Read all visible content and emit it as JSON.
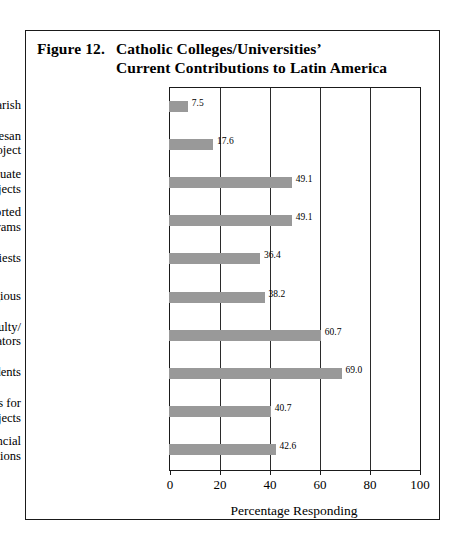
{
  "figure": {
    "number": "Figure 12.",
    "title_line1": "Catholic Colleges/Universities’",
    "title_line2": "Current Contributions to Latin America"
  },
  "chart_data": {
    "type": "bar",
    "orientation": "horizontal",
    "title": "Figure 12. Catholic Colleges/Universities’ Current Contributions to Latin America",
    "xlabel": "Percentage Responding",
    "ylabel": "",
    "xlim": [
      0,
      100
    ],
    "xticks": [
      "0",
      "20",
      "40",
      "60",
      "80",
      "100"
    ],
    "grid": "vertical",
    "legend": "none",
    "bar_color": "#999999",
    "categories": [
      "Adopt a Diocese/Parish",
      "Supported Diocesan\nProject",
      "Offered Graduate\nProjects",
      "Regularly Supported\nPrograms",
      "Sent Priests",
      "Sent Religious",
      "Sent Faculty/\nAdministrators",
      "Sent Students",
      "Raised Funds for\nService Projects",
      "Made Financial\nContributions"
    ],
    "values": [
      7.5,
      17.6,
      49.1,
      49.1,
      36.4,
      38.2,
      60.7,
      69.0,
      40.7,
      42.6
    ],
    "value_labels": [
      "7.5",
      "17.6",
      "49.1",
      "49.1",
      "36.4",
      "38.2",
      "60.7",
      "69.0",
      "40.7",
      "42.6"
    ]
  }
}
